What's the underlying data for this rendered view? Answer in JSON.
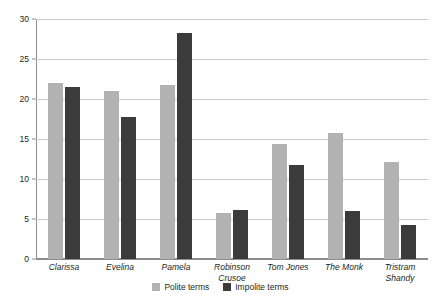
{
  "chart_data": {
    "type": "bar",
    "title": "",
    "subtitle": "",
    "xlabel": "",
    "ylabel": "",
    "ylim": [
      0,
      30
    ],
    "yticks": [
      0,
      5,
      10,
      15,
      20,
      25,
      30
    ],
    "grid": true,
    "legend_position": "bottom-center",
    "categories": [
      "Clarissa",
      "Evelina",
      "Pamela",
      "Robinson Crusoe",
      "Tom Jones",
      "The Monk",
      "Tristram Shandy"
    ],
    "category_lines": [
      [
        "Clarissa"
      ],
      [
        "Evelina"
      ],
      [
        "Pamela"
      ],
      [
        "Robinson",
        "Crusoe"
      ],
      [
        "Tom Jones"
      ],
      [
        "The Monk"
      ],
      [
        "Tristram",
        "Shandy"
      ]
    ],
    "series": [
      {
        "name": "Polite terms",
        "color": "#b2b2b2",
        "values": [
          22.0,
          21.0,
          21.7,
          5.8,
          14.4,
          15.8,
          12.1
        ]
      },
      {
        "name": "Impolite terms",
        "color": "#3b3b3b",
        "values": [
          21.5,
          17.7,
          28.2,
          6.1,
          11.8,
          6.0,
          4.2
        ]
      }
    ]
  },
  "colors": {
    "polite": "#b2b2b2",
    "impolite": "#3b3b3b",
    "gridline": "#c9c9c9",
    "axis": "#8c8c8c",
    "text": "#231f20",
    "background": "#ffffff"
  }
}
